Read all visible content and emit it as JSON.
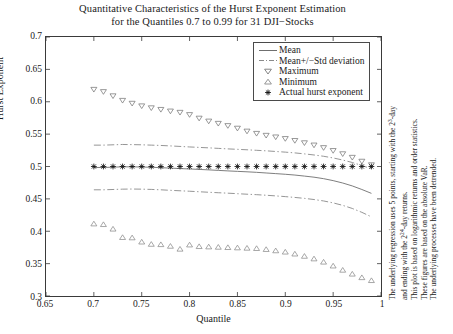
{
  "figure": {
    "title_lines": [
      "Quantitative Characteristics of the Hurst Exponent Estimation",
      "for the Quantiles 0.7 to 0.99 for 31 DJI−Stocks"
    ],
    "notes": [
      "The underlying regression uses 5 points, starting with the 2³-day",
      "and ending with the 2²⁴-day returns.",
      "This plot is based on logarithmic returns and order statistics.",
      "These figures are based on the absolute VaR.",
      "The underlying processes have been detrended."
    ],
    "note_sup": [
      "3",
      "24"
    ],
    "colors": {
      "axis": "#3a3a3a",
      "mean": "#6f6f6f",
      "band": "#8a8a8a",
      "maximum": "#777777",
      "minimum": "#8b8b8b",
      "actual": "#111111",
      "legend_border": "#4a4a4a",
      "background": "#ffffff"
    }
  },
  "chart_data": {
    "type": "line",
    "xlabel": "Quantile",
    "ylabel": "Hurst Exponent",
    "xlim": [
      0.65,
      1.0
    ],
    "ylim": [
      0.3,
      0.7
    ],
    "xticks": [
      0.65,
      0.7,
      0.75,
      0.8,
      0.85,
      0.9,
      0.95,
      1
    ],
    "xticklabels": [
      "0.65",
      "0.7",
      "0.75",
      "0.8",
      "0.85",
      "0.9",
      "0.95",
      "1"
    ],
    "yticks": [
      0.3,
      0.35,
      0.4,
      0.45,
      0.5,
      0.55,
      0.6,
      0.65,
      0.7
    ],
    "yticklabels": [
      "0.3",
      "0.35",
      "0.4",
      "0.45",
      "0.5",
      "0.55",
      "0.6",
      "0.65",
      "0.7"
    ],
    "grid": false,
    "legend_position": "upper right",
    "x": [
      0.7,
      0.71,
      0.72,
      0.73,
      0.74,
      0.75,
      0.76,
      0.77,
      0.78,
      0.79,
      0.8,
      0.81,
      0.82,
      0.83,
      0.84,
      0.85,
      0.86,
      0.87,
      0.88,
      0.89,
      0.9,
      0.91,
      0.92,
      0.93,
      0.94,
      0.95,
      0.96,
      0.97,
      0.98,
      0.99
    ],
    "series": [
      {
        "name": "Mean",
        "style": "solid-line",
        "values": [
          0.4985,
          0.4985,
          0.499,
          0.4995,
          0.4995,
          0.4992,
          0.4988,
          0.4982,
          0.4975,
          0.4968,
          0.4962,
          0.4955,
          0.4948,
          0.494,
          0.4932,
          0.4925,
          0.4918,
          0.491,
          0.49,
          0.489,
          0.488,
          0.4868,
          0.4852,
          0.4835,
          0.4812,
          0.4782,
          0.4745,
          0.47,
          0.4645,
          0.4585
        ]
      },
      {
        "name": "Mean+Std deviation",
        "style": "dash-dot-line",
        "values": [
          0.533,
          0.533,
          0.5335,
          0.534,
          0.5338,
          0.5335,
          0.533,
          0.5325,
          0.5318,
          0.531,
          0.5302,
          0.5295,
          0.5288,
          0.528,
          0.5272,
          0.5265,
          0.5258,
          0.525,
          0.5242,
          0.5232,
          0.5222,
          0.521,
          0.5195,
          0.5178,
          0.5158,
          0.5132,
          0.51,
          0.5062,
          0.5015,
          0.4965
        ]
      },
      {
        "name": "Mean-Std deviation",
        "style": "dash-dot-line",
        "values": [
          0.464,
          0.464,
          0.4645,
          0.465,
          0.4652,
          0.465,
          0.4646,
          0.464,
          0.4632,
          0.4625,
          0.4618,
          0.461,
          0.4602,
          0.4595,
          0.4588,
          0.458,
          0.4572,
          0.4565,
          0.4556,
          0.4546,
          0.4535,
          0.4522,
          0.4508,
          0.449,
          0.4468,
          0.4438,
          0.44,
          0.4352,
          0.4292,
          0.4222
        ]
      },
      {
        "name": "Maximum",
        "style": "marker-down-triangle",
        "values": [
          0.619,
          0.6155,
          0.609,
          0.602,
          0.5975,
          0.5935,
          0.5905,
          0.588,
          0.5855,
          0.5835,
          0.58,
          0.5745,
          0.57,
          0.5665,
          0.563,
          0.559,
          0.5545,
          0.551,
          0.548,
          0.5455,
          0.543,
          0.54,
          0.5365,
          0.533,
          0.529,
          0.5245,
          0.5195,
          0.514,
          0.508,
          0.5025
        ]
      },
      {
        "name": "Minimum",
        "style": "marker-up-triangle",
        "values": [
          0.4115,
          0.4105,
          0.4035,
          0.3905,
          0.39,
          0.3835,
          0.38,
          0.3795,
          0.377,
          0.3725,
          0.379,
          0.3765,
          0.376,
          0.3755,
          0.375,
          0.3745,
          0.374,
          0.3735,
          0.372,
          0.37,
          0.368,
          0.365,
          0.3615,
          0.3575,
          0.3525,
          0.3465,
          0.34,
          0.334,
          0.3285,
          0.324
        ]
      },
      {
        "name": "Actual hurst exponent",
        "style": "marker-asterisk",
        "values": [
          0.5,
          0.5,
          0.5,
          0.5,
          0.5,
          0.5,
          0.5,
          0.5,
          0.5,
          0.5,
          0.5,
          0.5,
          0.5,
          0.5,
          0.5,
          0.5,
          0.5,
          0.5,
          0.5,
          0.5,
          0.5,
          0.5,
          0.5,
          0.5,
          0.5,
          0.5,
          0.5,
          0.5,
          0.5,
          0.5
        ]
      }
    ],
    "legend": [
      {
        "label": "Mean",
        "key": "solid-line"
      },
      {
        "label": "Mean+/−Std deviation",
        "key": "dash-dot-line"
      },
      {
        "label": "Maximum",
        "key": "down-triangle"
      },
      {
        "label": "Minimum",
        "key": "up-triangle"
      },
      {
        "label": "Actual hurst exponent",
        "key": "asterisk"
      }
    ]
  }
}
